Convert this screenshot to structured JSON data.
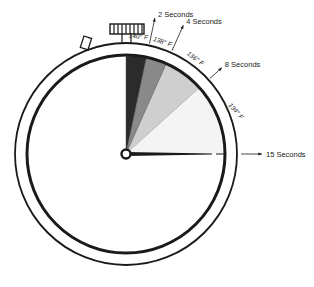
{
  "diagram": {
    "title": "",
    "type": "stopwatch-timing-diagram",
    "seconds_per_revolution": 60,
    "segments": [
      {
        "from_s": 0,
        "to_s": 2,
        "temperature": "140° F",
        "time_label": "2 Seconds",
        "shade": "#2b2b2b"
      },
      {
        "from_s": 2,
        "to_s": 4,
        "temperature": "138° F",
        "time_label": "4 Seconds",
        "shade": "#8a8a8a"
      },
      {
        "from_s": 4,
        "to_s": 8,
        "temperature": "136° F",
        "time_label": "8 Seconds",
        "shade": "#cfcfcf"
      },
      {
        "from_s": 8,
        "to_s": 15,
        "temperature": "134° F",
        "time_label": "15 Seconds",
        "shade": "#f4f4f4"
      }
    ],
    "hand_at_s": 15,
    "colors": {
      "line": "#1a1a1a",
      "background": "#ffffff"
    }
  }
}
